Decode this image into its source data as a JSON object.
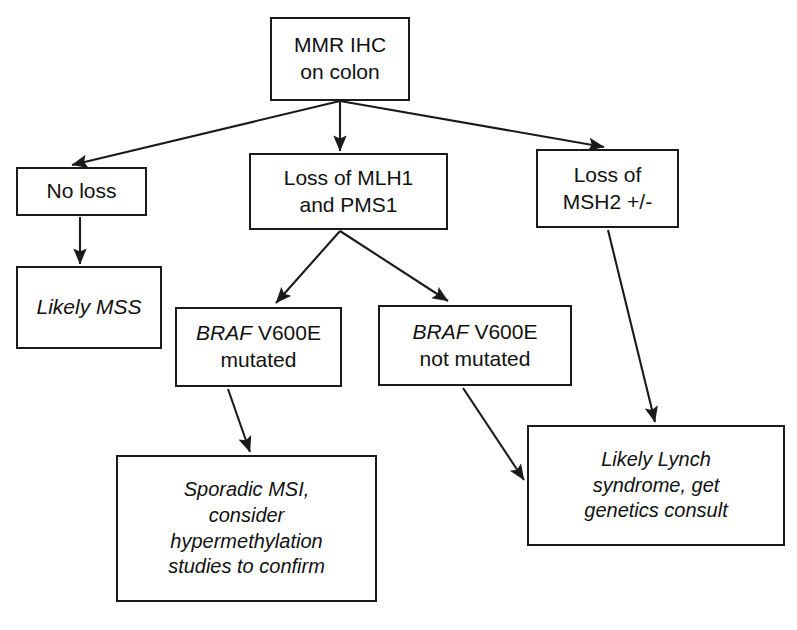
{
  "diagram": {
    "style": {
      "stroke": "#1a1a1a",
      "fill": "#ffffff",
      "text": "#111111"
    },
    "nodes": [
      {
        "id": "mmr-ihc",
        "name": "mmr-ihc-on-colon",
        "text": "MMR IHC\non colon",
        "emphasis": "none",
        "x": 270,
        "y": 17,
        "w": 140,
        "h": 84,
        "font_size": 21
      },
      {
        "id": "no-loss",
        "name": "no-loss",
        "text": "No loss",
        "emphasis": "none",
        "x": 16,
        "y": 167,
        "w": 131,
        "h": 49,
        "font_size": 21
      },
      {
        "id": "loss-mlh1-pms1",
        "name": "loss-of-mlh1-and-pms1",
        "text": "Loss of MLH1\nand PMS1",
        "emphasis": "none",
        "x": 249,
        "y": 153,
        "w": 199,
        "h": 77,
        "font_size": 21
      },
      {
        "id": "loss-msh2",
        "name": "loss-of-msh2",
        "text": "Loss of\nMSH2 +/-",
        "emphasis": "none",
        "x": 536,
        "y": 149,
        "w": 143,
        "h": 79,
        "font_size": 21
      },
      {
        "id": "likely-mss",
        "name": "likely-mss",
        "text": "Likely MSS",
        "emphasis": "italic",
        "x": 16,
        "y": 266,
        "w": 146,
        "h": 83,
        "font_size": 21
      },
      {
        "id": "braf-mutated",
        "name": "braf-v600e-mutated",
        "text": "BRAF V600E\nmutated",
        "emphasis": "mixed",
        "italic_prefix": "BRAF",
        "rest_line1": " V600E",
        "line2": "mutated",
        "x": 175,
        "y": 307,
        "w": 167,
        "h": 80,
        "font_size": 21
      },
      {
        "id": "braf-not-mutated",
        "name": "braf-v600e-not-mutated",
        "text": "BRAF V600E\nnot mutated",
        "emphasis": "mixed",
        "italic_prefix": "BRAF",
        "rest_line1": " V600E",
        "line2": "not mutated",
        "x": 378,
        "y": 305,
        "w": 194,
        "h": 81,
        "font_size": 21
      },
      {
        "id": "sporadic-msi",
        "name": "sporadic-msi-hypermethylation",
        "text": "Sporadic MSI,\nconsider\nhypermethylation\nstudies to confirm",
        "emphasis": "italic",
        "x": 116,
        "y": 455,
        "w": 261,
        "h": 147,
        "font_size": 20
      },
      {
        "id": "likely-lynch",
        "name": "likely-lynch-syndrome",
        "text": "Likely Lynch\nsyndrome, get\ngenetics consult",
        "emphasis": "italic",
        "x": 527,
        "y": 425,
        "w": 258,
        "h": 121,
        "font_size": 20
      }
    ],
    "edges": [
      {
        "id": "e1",
        "name": "edge-mmr-to-no-loss",
        "from": "mmr-ihc",
        "to": "no-loss",
        "x1": 340,
        "y1": 101,
        "x2": 72,
        "y2": 165
      },
      {
        "id": "e2",
        "name": "edge-mmr-to-loss-mlh1",
        "from": "mmr-ihc",
        "to": "loss-mlh1-pms1",
        "x1": 340,
        "y1": 101,
        "x2": 340,
        "y2": 151
      },
      {
        "id": "e3",
        "name": "edge-mmr-to-loss-msh2",
        "from": "mmr-ihc",
        "to": "loss-msh2",
        "x1": 340,
        "y1": 101,
        "x2": 604,
        "y2": 147
      },
      {
        "id": "e4",
        "name": "edge-no-loss-to-likely-mss",
        "from": "no-loss",
        "to": "likely-mss",
        "x1": 80,
        "y1": 217,
        "x2": 80,
        "y2": 264
      },
      {
        "id": "e5",
        "name": "edge-mlh1-to-braf-mutated",
        "from": "loss-mlh1-pms1",
        "to": "braf-mutated",
        "x1": 340,
        "y1": 231,
        "x2": 276,
        "y2": 303
      },
      {
        "id": "e6",
        "name": "edge-mlh1-to-braf-not-mutated",
        "from": "loss-mlh1-pms1",
        "to": "braf-not-mutated",
        "x1": 340,
        "y1": 231,
        "x2": 448,
        "y2": 301
      },
      {
        "id": "e7",
        "name": "edge-braf-mutated-to-sporadic",
        "from": "braf-mutated",
        "to": "sporadic-msi",
        "x1": 228,
        "y1": 389,
        "x2": 250,
        "y2": 452
      },
      {
        "id": "e8",
        "name": "edge-braf-not-mutated-to-lynch",
        "from": "braf-not-mutated",
        "to": "likely-lynch",
        "x1": 463,
        "y1": 388,
        "x2": 524,
        "y2": 480
      },
      {
        "id": "e9",
        "name": "edge-msh2-to-lynch",
        "from": "loss-msh2",
        "to": "likely-lynch",
        "x1": 608,
        "y1": 230,
        "x2": 655,
        "y2": 422
      }
    ]
  }
}
